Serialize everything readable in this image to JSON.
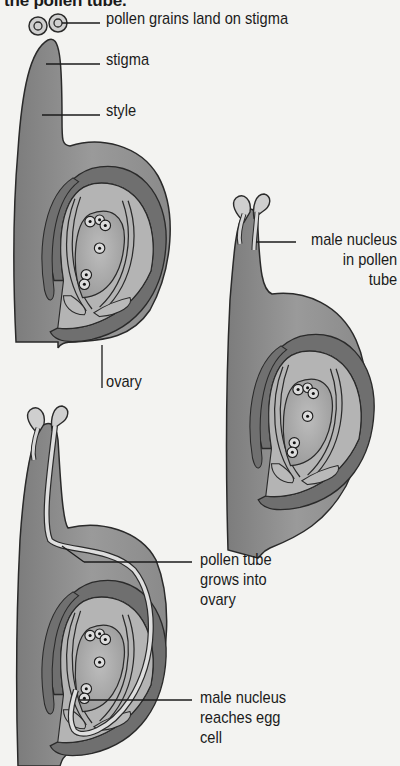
{
  "caption": {
    "top_text": "the pollen tube."
  },
  "colors": {
    "background": "#f3f3f1",
    "outer_tissue": "#8d8d8d",
    "inner_light": "#b9b9b9",
    "ovary_wall_dark": "#6f6f6f",
    "ovule": "#a9a9a9",
    "pollen_light": "#d2d2d2",
    "outline": "#2a2a2a"
  },
  "stages": [
    {
      "id": "stage-1",
      "labels": {
        "pollen_grains": "pollen grains land on stigma",
        "stigma": "stigma",
        "style": "style",
        "ovary": "ovary"
      }
    },
    {
      "id": "stage-2",
      "labels": {
        "male_nucleus": [
          "male nucleus",
          "in pollen",
          "tube"
        ]
      }
    },
    {
      "id": "stage-3",
      "labels": {
        "pollen_tube": [
          "pollen tube",
          "grows into",
          "ovary"
        ],
        "male_nucleus_egg": [
          "male nucleus",
          "reaches egg",
          "cell"
        ]
      }
    }
  ]
}
